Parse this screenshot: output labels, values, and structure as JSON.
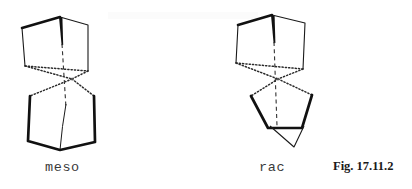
{
  "figure": {
    "caption": "Fig. 17.11.2",
    "background_color": "#ffffff",
    "line_color": "#1a1a1a",
    "label_color": "#3a3a3a",
    "width": 412,
    "height": 189
  },
  "structures": [
    {
      "id": "meso",
      "label": "meso",
      "description": "spiro bicyclic stereoisomer, meso form",
      "spiro_center": {
        "x": 72,
        "y": 79
      },
      "upper_ring": {
        "vertices": [
          {
            "x": 60,
            "y": 17
          },
          {
            "x": 22,
            "y": 28
          },
          {
            "x": 25,
            "y": 66
          },
          {
            "x": 88,
            "y": 71
          },
          {
            "x": 88,
            "y": 25
          }
        ],
        "bold_edges": [
          [
            0,
            1
          ]
        ],
        "plain_edges": [
          [
            1,
            2
          ],
          [
            3,
            4
          ],
          [
            4,
            0
          ]
        ],
        "dotted_edges": [
          [
            2,
            3
          ]
        ]
      },
      "lower_ring": {
        "vertices": [
          {
            "x": 30,
            "y": 96
          },
          {
            "x": 28,
            "y": 141
          },
          {
            "x": 60,
            "y": 150
          },
          {
            "x": 95,
            "y": 142
          },
          {
            "x": 94,
            "y": 96
          }
        ],
        "bold_edges": [
          [
            0,
            1
          ],
          [
            1,
            2
          ],
          [
            2,
            3
          ],
          [
            3,
            4
          ]
        ],
        "plain_edges": [],
        "dotted_edges": []
      },
      "spiro_bonds_dotted": [
        {
          "x": 25,
          "y": 66
        },
        {
          "x": 88,
          "y": 71
        },
        {
          "x": 30,
          "y": 96
        },
        {
          "x": 94,
          "y": 96
        }
      ],
      "axis_dashed": {
        "x1": 62,
        "y1": 42,
        "x2": 62,
        "y2": 108
      },
      "axis_thin": {
        "x1": 63,
        "y1": 104,
        "x2": 60,
        "y2": 150
      },
      "wedge": {
        "tip_x": 60,
        "tip_y": 17,
        "base_x": 62,
        "base_y": 44
      }
    },
    {
      "id": "rac",
      "label": "rac",
      "description": "spiro bicyclic stereoisomer, racemic form",
      "spiro_center": {
        "x": 278,
        "y": 79
      },
      "upper_ring": {
        "vertices": [
          {
            "x": 272,
            "y": 15
          },
          {
            "x": 238,
            "y": 25
          },
          {
            "x": 236,
            "y": 63
          },
          {
            "x": 303,
            "y": 69
          },
          {
            "x": 305,
            "y": 23
          }
        ],
        "bold_edges": [
          [
            0,
            1
          ]
        ],
        "plain_edges": [
          [
            1,
            2
          ],
          [
            3,
            4
          ],
          [
            4,
            0
          ]
        ],
        "dotted_edges": [
          [
            2,
            3
          ]
        ]
      },
      "lower_ring": {
        "vertices": [
          {
            "x": 251,
            "y": 96
          },
          {
            "x": 268,
            "y": 128
          },
          {
            "x": 302,
            "y": 128
          },
          {
            "x": 312,
            "y": 95
          },
          {
            "x": 294,
            "y": 145
          }
        ],
        "bold_edges": [
          [
            0,
            1
          ],
          [
            1,
            2
          ],
          [
            2,
            3
          ]
        ],
        "plain_edges": [],
        "dotted_edges": []
      },
      "spiro_bonds_dotted": [
        {
          "x": 236,
          "y": 63
        },
        {
          "x": 303,
          "y": 69
        },
        {
          "x": 251,
          "y": 96
        },
        {
          "x": 312,
          "y": 95
        }
      ],
      "axis_dashed": {
        "x1": 274,
        "y1": 40,
        "x2": 276,
        "y2": 124
      },
      "axis_thin": {
        "x1": 276,
        "y1": 124,
        "x2": 294,
        "y2": 145
      },
      "wedge": {
        "tip_x": 272,
        "tip_y": 15,
        "base_x": 274,
        "base_y": 42
      }
    }
  ]
}
